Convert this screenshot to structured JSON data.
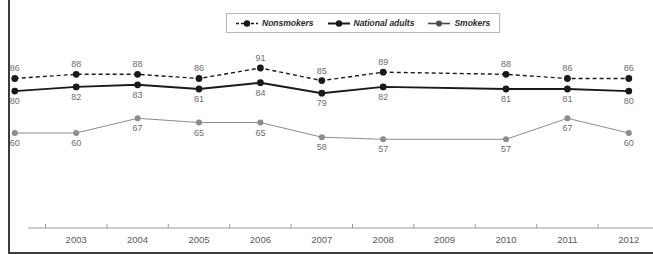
{
  "chart_data": {
    "type": "line",
    "title": "",
    "xlabel": "",
    "ylabel": "",
    "grid": false,
    "legend_position": "top-center",
    "x": [
      2002.5,
      2003.5,
      2004.5,
      2005.5,
      2006.5,
      2007.5,
      2008.5,
      2010.5,
      2011.5,
      2012.5
    ],
    "tick_labels": [
      "2003",
      "2004",
      "2005",
      "2006",
      "2007",
      "2008",
      "2009",
      "2010",
      "2011",
      "2012"
    ],
    "ylim": [
      50,
      95
    ],
    "series": [
      {
        "name": "Nonsmokers",
        "style": "dashed",
        "color": "#1a1a1a",
        "values": [
          86,
          88,
          88,
          86,
          91,
          85,
          89,
          88,
          86,
          86
        ]
      },
      {
        "name": "National adults",
        "style": "solid-thick",
        "color": "#1a1a1a",
        "values": [
          80,
          82,
          83,
          81,
          84,
          79,
          82,
          81,
          81,
          80
        ]
      },
      {
        "name": "Smokers",
        "style": "solid-thin",
        "color": "#8c8c8c",
        "values": [
          60,
          60,
          67,
          65,
          65,
          58,
          57,
          57,
          67,
          60
        ]
      }
    ]
  },
  "legend": {
    "items": [
      {
        "label": "Nonsmokers",
        "icon": "dashed-line-marker-icon"
      },
      {
        "label": "National adults",
        "icon": "solid-line-marker-icon"
      },
      {
        "label": "Smokers",
        "icon": "gray-line-marker-icon"
      }
    ]
  },
  "colors": {
    "dark": "#1a1a1a",
    "gray": "#8c8c8c",
    "label": "#6e6e6e",
    "rule": "#3c3c3c",
    "legend_border": "#b9b9b9"
  }
}
